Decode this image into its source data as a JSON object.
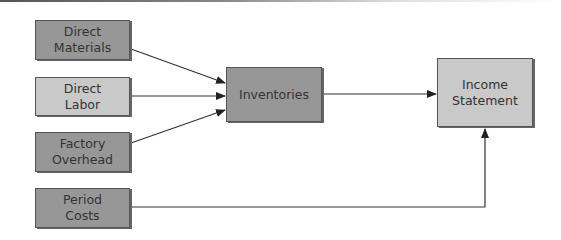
{
  "diagram": {
    "nodes": {
      "direct_materials": {
        "label": "Direct\nMaterials"
      },
      "direct_labor": {
        "label": "Direct\nLabor"
      },
      "factory_overhead": {
        "label": "Factory\nOverhead"
      },
      "period_costs": {
        "label": "Period\nCosts"
      },
      "inventories": {
        "label": "Inventories"
      },
      "income_statement": {
        "label": "Income\nStatement"
      }
    },
    "edges": [
      {
        "from": "Direct Materials",
        "to": "Inventories"
      },
      {
        "from": "Direct Labor",
        "to": "Inventories"
      },
      {
        "from": "Factory Overhead",
        "to": "Inventories"
      },
      {
        "from": "Inventories",
        "to": "Income Statement"
      },
      {
        "from": "Period Costs",
        "to": "Income Statement"
      }
    ],
    "colors": {
      "box_dark": "#979797",
      "box_light": "#c9c9c9",
      "line": "#333333"
    }
  }
}
